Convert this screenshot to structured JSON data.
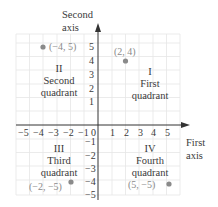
{
  "axes": {
    "y_axis_label_line1": "Second",
    "y_axis_label_line2": "axis",
    "x_axis_label_line1": "First",
    "x_axis_label_line2": "axis",
    "origin_label": "0"
  },
  "x_ticks_negative": [
    "−5",
    "−4",
    "−3",
    "−2",
    "−1"
  ],
  "x_ticks_positive": [
    "1",
    "2",
    "3",
    "4",
    "5"
  ],
  "y_ticks_positive": [
    "5",
    "4",
    "3",
    "2",
    "1"
  ],
  "y_ticks_negative": [
    "−1",
    "−2",
    "−3",
    "−4",
    "−5"
  ],
  "quadrants": {
    "first": {
      "numeral": "I",
      "line1": "First",
      "line2": "quadrant"
    },
    "second": {
      "numeral": "II",
      "line1": "Second",
      "line2": "quadrant"
    },
    "third": {
      "numeral": "III",
      "line1": "Third",
      "line2": "quadrant"
    },
    "fourth": {
      "numeral": "IV",
      "line1": "Fourth",
      "line2": "quadrant"
    }
  },
  "points": [
    {
      "label": "(−4, 5)",
      "x": -4,
      "y": 5
    },
    {
      "label": "(2, 4)",
      "x": 2,
      "y": 4
    },
    {
      "label": "(−2, −5)",
      "x": -2,
      "y": -5
    },
    {
      "label": "(5, −5)",
      "x": 5,
      "y": -5
    }
  ],
  "colors": {
    "grid": "#e6e6e6",
    "axis": "#333333",
    "point": "#8a8a8a",
    "text": "#3a3a3a"
  }
}
